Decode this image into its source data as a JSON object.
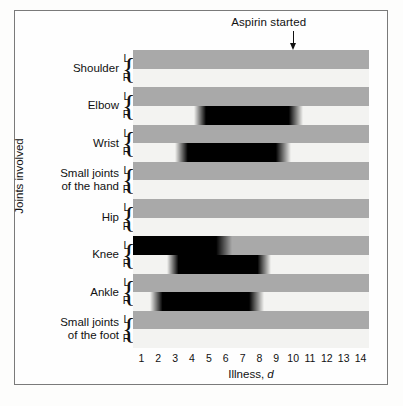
{
  "annotation": {
    "aspirin_label": "Aspirin started",
    "aspirin_day": 10
  },
  "axes": {
    "x_title_text": "Illness,",
    "x_title_variable": "d",
    "y_title": "Joints involved",
    "side_left": "L",
    "side_right": "R"
  },
  "colors": {
    "left_row": "#a9a9a9",
    "right_row": "#f3f3f1",
    "active_band": "#000000",
    "frame": "#7a7a7a",
    "text": "#111111"
  },
  "chart_data": {
    "type": "bar",
    "title": "",
    "subtitle": "",
    "xlabel": "Illness, d",
    "ylabel": "Joints involved",
    "xlim": [
      0.5,
      14.5
    ],
    "x_ticks": [
      1,
      2,
      3,
      4,
      5,
      6,
      7,
      8,
      9,
      10,
      11,
      12,
      13,
      14
    ],
    "grid": false,
    "legend": null,
    "annotations": [
      {
        "text": "Aspirin started",
        "x": 10,
        "type": "arrow-down"
      }
    ],
    "categories": [
      "Shoulder L",
      "Shoulder R",
      "Elbow L",
      "Elbow R",
      "Wrist L",
      "Wrist R",
      "Small joints of the hand L",
      "Small joints of the hand R",
      "Hip L",
      "Hip R",
      "Knee L",
      "Knee R",
      "Ankle L",
      "Ankle R",
      "Small joints of the foot L",
      "Small joints of the foot R"
    ],
    "groups": [
      {
        "name": "Shoulder",
        "rows": [
          {
            "side": "L",
            "active": false,
            "start_day": null,
            "end_day": null
          },
          {
            "side": "R",
            "active": false,
            "start_day": null,
            "end_day": null
          }
        ]
      },
      {
        "name": "Elbow",
        "rows": [
          {
            "side": "L",
            "active": false,
            "start_day": null,
            "end_day": null
          },
          {
            "side": "R",
            "active": true,
            "start_day": 4.1,
            "end_day": 10.6
          }
        ]
      },
      {
        "name": "Wrist",
        "rows": [
          {
            "side": "L",
            "active": false,
            "start_day": null,
            "end_day": null
          },
          {
            "side": "R",
            "active": true,
            "start_day": 3.0,
            "end_day": 9.9
          }
        ]
      },
      {
        "name": "Small joints\nof the hand",
        "rows": [
          {
            "side": "L",
            "active": false,
            "start_day": null,
            "end_day": null
          },
          {
            "side": "R",
            "active": false,
            "start_day": null,
            "end_day": null
          }
        ]
      },
      {
        "name": "Hip",
        "rows": [
          {
            "side": "L",
            "active": false,
            "start_day": null,
            "end_day": null
          },
          {
            "side": "R",
            "active": false,
            "start_day": null,
            "end_day": null
          }
        ]
      },
      {
        "name": "Knee",
        "rows": [
          {
            "side": "L",
            "active": true,
            "start_day": 0.5,
            "end_day": 6.4,
            "fade": "right"
          },
          {
            "side": "R",
            "active": true,
            "start_day": 2.5,
            "end_day": 8.7
          }
        ]
      },
      {
        "name": "Ankle",
        "rows": [
          {
            "side": "L",
            "active": false,
            "start_day": null,
            "end_day": null
          },
          {
            "side": "R",
            "active": true,
            "start_day": 1.5,
            "end_day": 8.3
          }
        ]
      },
      {
        "name": "Small joints\nof the foot",
        "rows": [
          {
            "side": "L",
            "active": false,
            "start_day": null,
            "end_day": null
          },
          {
            "side": "R",
            "active": false,
            "start_day": null,
            "end_day": null
          }
        ]
      }
    ]
  }
}
